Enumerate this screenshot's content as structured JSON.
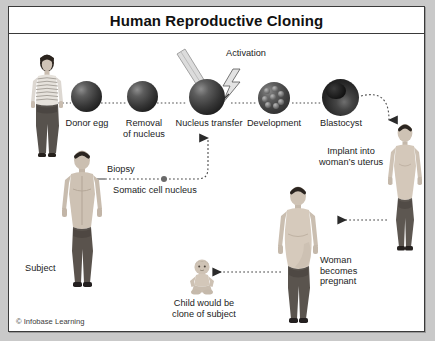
{
  "figure": {
    "title": "Human Reproductive Cloning",
    "credit": "© Infobase Learning",
    "border_color": "#3a3a3a",
    "background_color": "#ffffff",
    "page_background": "#c9c9c9"
  },
  "process_labels": {
    "donor_egg": "Donor egg",
    "removal_of_nucleus": "Removal\nof nucleus",
    "nucleus_transfer": "Nucleus transfer",
    "development": "Development",
    "blastocyst": "Blastocyst",
    "activation": "Activation",
    "implant": "Implant into\nwoman’s uterus",
    "biopsy": "Biopsy",
    "somatic_cell_nucleus": "Somatic cell nucleus",
    "subject": "Subject",
    "woman_becomes_pregnant": "Woman\nbecomes\npregnant",
    "child_clone": "Child would be\nclone of subject"
  },
  "figures": {
    "egg_donor": "egg-donor-woman",
    "subject": "subject-man",
    "recipient": "recipient-woman",
    "pregnant": "pregnant-woman",
    "child": "child-baby"
  },
  "stages": [
    {
      "id": "donor-egg",
      "label": "Donor egg",
      "kind": "oocyte"
    },
    {
      "id": "removal-of-nucleus",
      "label": "Removal of nucleus",
      "kind": "enucleated"
    },
    {
      "id": "nucleus-transfer",
      "label": "Nucleus transfer",
      "kind": "fused"
    },
    {
      "id": "development",
      "label": "Development",
      "kind": "morula"
    },
    {
      "id": "blastocyst",
      "label": "Blastocyst",
      "kind": "blastocyst"
    }
  ],
  "colors": {
    "ink": "#1b1b1b",
    "cell_dark": "#1d1d1d",
    "cell_light": "#8e8e8e",
    "dotted_line": "#555555",
    "skin": "#d9cfc4",
    "hair": "#2b2520",
    "pants": "#55504c",
    "top": "#e8e4de"
  }
}
